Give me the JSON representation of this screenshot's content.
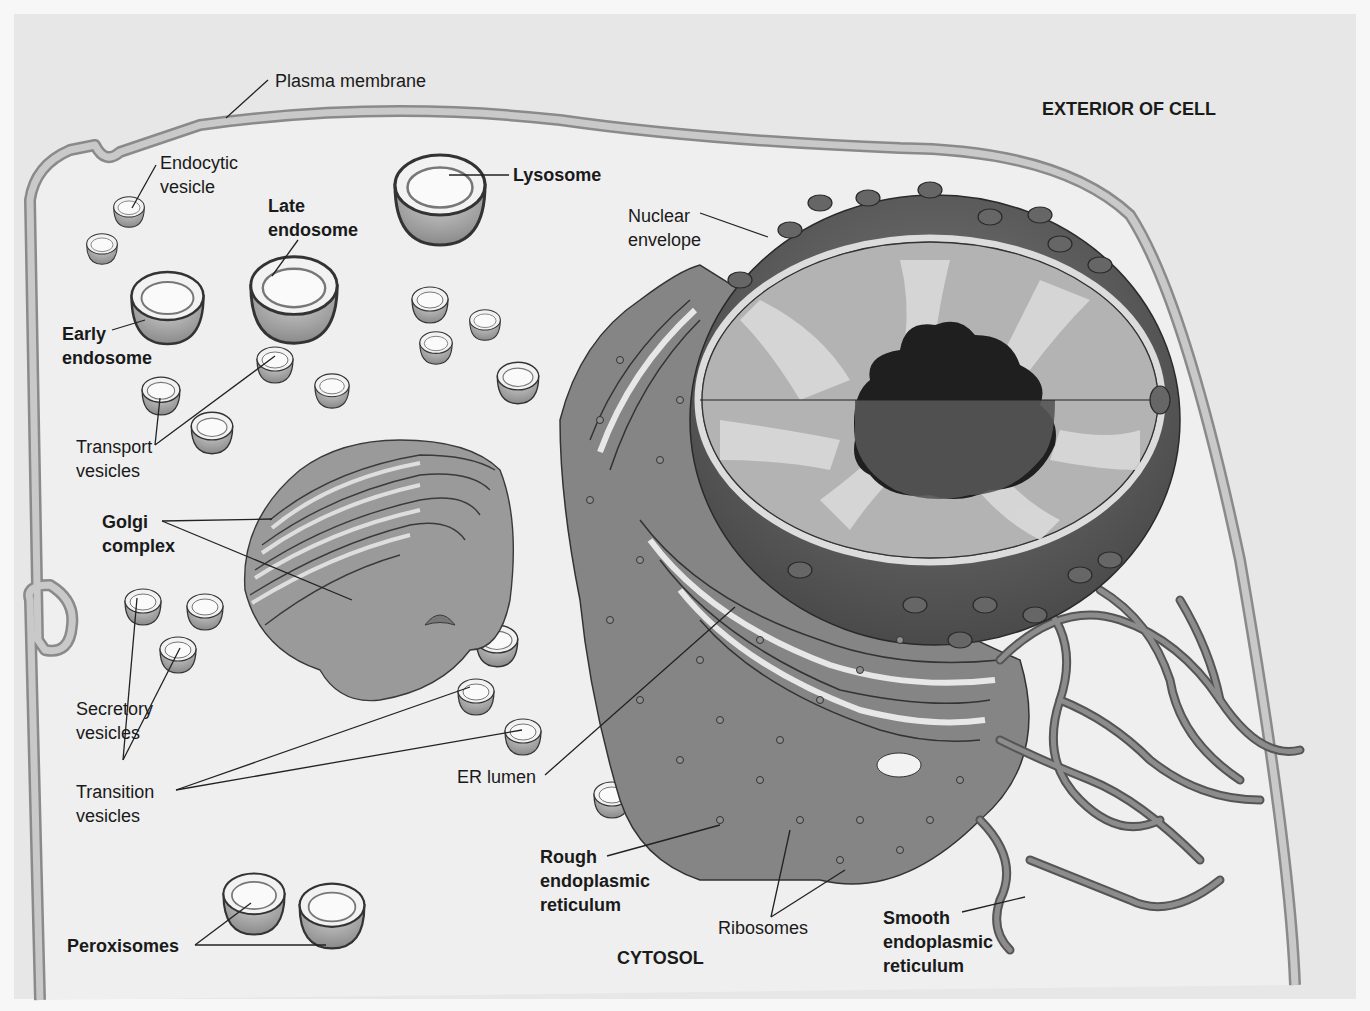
{
  "diagram": {
    "regions": {
      "exterior": "EXTERIOR OF CELL",
      "cytosol": "CYTOSOL"
    },
    "labels": {
      "plasma_membrane": "Plasma membrane",
      "endocytic_vesicle": [
        "Endocytic",
        "vesicle"
      ],
      "late_endosome": [
        "Late",
        "endosome"
      ],
      "lysosome": "Lysosome",
      "nuclear_envelope": [
        "Nuclear",
        "envelope"
      ],
      "early_endosome": [
        "Early",
        "endosome"
      ],
      "transport_vesicles": [
        "Transport",
        "vesicles"
      ],
      "golgi_complex": [
        "Golgi",
        "complex"
      ],
      "secretory_vesicles": [
        "Secretory",
        "vesicles"
      ],
      "transition_vesicles": [
        "Transition",
        "vesicles"
      ],
      "er_lumen": "ER lumen",
      "rough_er": [
        "Rough",
        "endoplasmic",
        "reticulum"
      ],
      "peroxisomes": "Peroxisomes",
      "ribosomes": "Ribosomes",
      "smooth_er": [
        "Smooth",
        "endoplasmic",
        "reticulum"
      ]
    },
    "colors": {
      "background": "#e6e6e6",
      "cell_interior": "#ededed",
      "membrane": "#b4b4b4",
      "organelle": "#9a9a9a",
      "nucleus_dark": "#5e5e5e",
      "nucleolus": "#222222"
    }
  }
}
